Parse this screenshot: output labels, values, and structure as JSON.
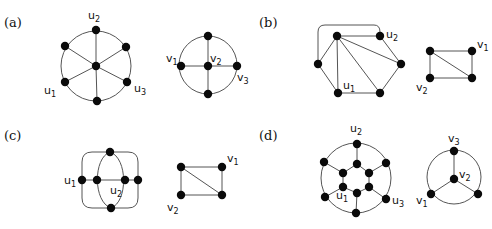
{
  "figure": {
    "panels": [
      {
        "id": "a",
        "label": "(a)",
        "label_pos": [
          4,
          27
        ],
        "graphs": [
          {
            "name": "left-graph",
            "circles": [
              {
                "cx": 96,
                "cy": 66,
                "r": 35
              }
            ],
            "nodes": [
              {
                "id": "u2",
                "x": 96,
                "y": 30
              },
              {
                "id": "ul",
                "x": 65,
                "y": 46
              },
              {
                "id": "ur",
                "x": 126,
                "y": 47
              },
              {
                "id": "c",
                "x": 96,
                "y": 66
              },
              {
                "id": "u1",
                "x": 65,
                "y": 82
              },
              {
                "id": "u3",
                "x": 127,
                "y": 82
              },
              {
                "id": "b",
                "x": 97,
                "y": 101
              }
            ],
            "edges": [
              [
                "c",
                "u2"
              ],
              [
                "c",
                "ul"
              ],
              [
                "c",
                "ur"
              ],
              [
                "c",
                "u1"
              ],
              [
                "c",
                "u3"
              ],
              [
                "c",
                "b"
              ]
            ],
            "paths": [],
            "labels": [
              {
                "text": "u",
                "sub": "2",
                "x": 88,
                "y": 19
              },
              {
                "text": "u",
                "sub": "1",
                "x": 44,
                "y": 94
              },
              {
                "text": "u",
                "sub": "3",
                "x": 134,
                "y": 92
              }
            ]
          },
          {
            "name": "right-graph",
            "circles": [
              {
                "cx": 208,
                "cy": 65,
                "r": 29
              }
            ],
            "nodes": [
              {
                "id": "t",
                "x": 208,
                "y": 36
              },
              {
                "id": "v1",
                "x": 181,
                "y": 66
              },
              {
                "id": "v2",
                "x": 208,
                "y": 66
              },
              {
                "id": "v3",
                "x": 237,
                "y": 66
              },
              {
                "id": "bt",
                "x": 208,
                "y": 94
              }
            ],
            "edges": [
              [
                "v1",
                "v3"
              ],
              [
                "t",
                "bt"
              ]
            ],
            "paths": [],
            "labels": [
              {
                "text": "v",
                "sub": "1",
                "x": 166,
                "y": 62
              },
              {
                "text": "v",
                "sub": "2",
                "x": 210,
                "y": 62
              },
              {
                "text": "v",
                "sub": "3",
                "x": 237,
                "y": 81
              }
            ]
          }
        ]
      },
      {
        "id": "b",
        "label": "(b)",
        "label_pos": [
          259,
          27
        ],
        "graphs": [
          {
            "name": "left-graph",
            "circles": [],
            "nodes": [
              {
                "id": "tl",
                "x": 337,
                "y": 36
              },
              {
                "id": "u2",
                "x": 380,
                "y": 36
              },
              {
                "id": "l",
                "x": 318,
                "y": 64
              },
              {
                "id": "r",
                "x": 401,
                "y": 64
              },
              {
                "id": "u1",
                "x": 338,
                "y": 93
              },
              {
                "id": "br",
                "x": 380,
                "y": 93
              }
            ],
            "edges": [
              [
                "tl",
                "u2"
              ],
              [
                "tl",
                "l"
              ],
              [
                "tl",
                "u1"
              ],
              [
                "tl",
                "br"
              ],
              [
                "tl",
                "r"
              ],
              [
                "u2",
                "r"
              ],
              [
                "r",
                "br"
              ],
              [
                "br",
                "u1"
              ],
              [
                "u1",
                "l"
              ]
            ],
            "paths": [
              "M 318 64 L 318 32 Q 318 25 325 25 L 374 25 Q 380 25 380 32 L 380 36"
            ],
            "labels": [
              {
                "text": "u",
                "sub": "2",
                "x": 386,
                "y": 38
              },
              {
                "text": "u",
                "sub": "1",
                "x": 343,
                "y": 89
              }
            ]
          },
          {
            "name": "right-graph",
            "circles": [],
            "nodes": [
              {
                "id": "tl",
                "x": 430,
                "y": 51
              },
              {
                "id": "v1",
                "x": 472,
                "y": 51
              },
              {
                "id": "v2",
                "x": 430,
                "y": 78
              },
              {
                "id": "br",
                "x": 472,
                "y": 78
              }
            ],
            "edges": [
              [
                "tl",
                "v1"
              ],
              [
                "v1",
                "br"
              ],
              [
                "br",
                "v2"
              ],
              [
                "v2",
                "tl"
              ],
              [
                "tl",
                "br"
              ]
            ],
            "paths": [],
            "labels": [
              {
                "text": "v",
                "sub": "1",
                "x": 477,
                "y": 48
              },
              {
                "text": "v",
                "sub": "2",
                "x": 416,
                "y": 91
              }
            ]
          }
        ]
      },
      {
        "id": "c",
        "label": "(c)",
        "label_pos": [
          4,
          140
        ],
        "graphs": [
          {
            "name": "left-graph",
            "circles": [],
            "nodes": [
              {
                "id": "t",
                "x": 110,
                "y": 152
              },
              {
                "id": "u1",
                "x": 82,
                "y": 180
              },
              {
                "id": "il",
                "x": 97,
                "y": 180
              },
              {
                "id": "u2",
                "x": 125,
                "y": 180
              },
              {
                "id": "r",
                "x": 138,
                "y": 180
              },
              {
                "id": "b",
                "x": 111,
                "y": 208
              }
            ],
            "edges": [
              [
                "u1",
                "r"
              ]
            ],
            "paths": [
              "M 82 162 Q 82 152 92 152 L 128 152 Q 138 152 138 162 L 138 198 Q 138 208 128 208 L 92 208 Q 82 208 82 198 Z",
              "M 110 152 C 93 158 93 202 111 208",
              "M 110 152 C 128 158 128 202 111 208"
            ],
            "labels": [
              {
                "text": "u",
                "sub": "1",
                "x": 64,
                "y": 184
              },
              {
                "text": "u",
                "sub": "2",
                "x": 110,
                "y": 194
              }
            ]
          },
          {
            "name": "right-graph",
            "circles": [],
            "nodes": [
              {
                "id": "tl",
                "x": 181,
                "y": 167
              },
              {
                "id": "v1",
                "x": 222,
                "y": 167
              },
              {
                "id": "v2",
                "x": 181,
                "y": 195
              },
              {
                "id": "br",
                "x": 222,
                "y": 195
              }
            ],
            "edges": [
              [
                "tl",
                "v1"
              ],
              [
                "v1",
                "br"
              ],
              [
                "br",
                "v2"
              ],
              [
                "v2",
                "tl"
              ],
              [
                "tl",
                "br"
              ]
            ],
            "paths": [],
            "labels": [
              {
                "text": "v",
                "sub": "1",
                "x": 227,
                "y": 162
              },
              {
                "text": "v",
                "sub": "2",
                "x": 167,
                "y": 211
              }
            ]
          }
        ]
      },
      {
        "id": "d",
        "label": "(d)",
        "label_pos": [
          259,
          140
        ],
        "graphs": [
          {
            "name": "left-graph",
            "circles": [
              {
                "cx": 356,
                "cy": 178,
                "r": 35
              }
            ],
            "nodes": [
              {
                "id": "u2",
                "x": 357,
                "y": 144
              },
              {
                "id": "ol",
                "x": 324,
                "y": 162
              },
              {
                "id": "or",
                "x": 386,
                "y": 163
              },
              {
                "id": "u1o",
                "x": 325,
                "y": 197
              },
              {
                "id": "u3",
                "x": 386,
                "y": 199
              },
              {
                "id": "ob",
                "x": 356,
                "y": 213
              },
              {
                "id": "ht",
                "x": 357,
                "y": 164
              },
              {
                "id": "hul",
                "x": 343,
                "y": 173
              },
              {
                "id": "hur",
                "x": 369,
                "y": 173
              },
              {
                "id": "hll",
                "x": 343,
                "y": 187
              },
              {
                "id": "hlr",
                "x": 369,
                "y": 187
              },
              {
                "id": "hb",
                "x": 357,
                "y": 193
              }
            ],
            "edges": [
              [
                "ht",
                "hul"
              ],
              [
                "hul",
                "hll"
              ],
              [
                "hll",
                "hb"
              ],
              [
                "hb",
                "hlr"
              ],
              [
                "hlr",
                "hur"
              ],
              [
                "hur",
                "ht"
              ],
              [
                "u2",
                "ht"
              ],
              [
                "ol",
                "hul"
              ],
              [
                "or",
                "hur"
              ],
              [
                "u1o",
                "hll"
              ],
              [
                "u3",
                "hlr"
              ],
              [
                "ob",
                "hb"
              ]
            ],
            "paths": [],
            "labels": [
              {
                "text": "u",
                "sub": "2",
                "x": 350,
                "y": 132
              },
              {
                "text": "u",
                "sub": "1",
                "x": 336,
                "y": 199
              },
              {
                "text": "u",
                "sub": "3",
                "x": 392,
                "y": 204
              }
            ]
          },
          {
            "name": "right-graph",
            "circles": [
              {
                "cx": 454,
                "cy": 177,
                "r": 27
              }
            ],
            "nodes": [
              {
                "id": "v3",
                "x": 454,
                "y": 151
              },
              {
                "id": "v2",
                "x": 454,
                "y": 179
              },
              {
                "id": "v1",
                "x": 431,
                "y": 194
              },
              {
                "id": "r",
                "x": 478,
                "y": 194
              }
            ],
            "edges": [
              [
                "v2",
                "v3"
              ],
              [
                "v2",
                "v1"
              ],
              [
                "v2",
                "r"
              ]
            ],
            "paths": [],
            "labels": [
              {
                "text": "v",
                "sub": "3",
                "x": 448,
                "y": 142
              },
              {
                "text": "v",
                "sub": "2",
                "x": 459,
                "y": 178
              },
              {
                "text": "v",
                "sub": "1",
                "x": 416,
                "y": 204
              }
            ]
          }
        ]
      }
    ],
    "node_radius": 4.2,
    "colors": {
      "node": "#0a0a0a",
      "edge": "#555555",
      "text": "#111111",
      "background": "#ffffff"
    }
  }
}
